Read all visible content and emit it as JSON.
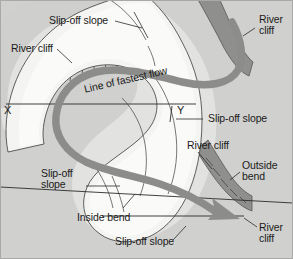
{
  "figure": {
    "width": 293,
    "height": 259,
    "background_color": "#d0d0ce",
    "land_color": "#c8c8c6",
    "slope_color": "#e4e4e2",
    "water_color": "#f2f2f0",
    "cliff_color": "#8d8d8b",
    "flow_color": "#8a8a88",
    "line_color": "#2b2b2b"
  },
  "labels": {
    "slip_off_slope_top": "Slip-off slope",
    "river_cliff_left": "River cliff",
    "river_cliff_topright_l1": "River",
    "river_cliff_topright_l2": "cliff",
    "line_of_fastest_flow": "Line of fastest flow",
    "point_x": "X",
    "point_y": "Y",
    "slip_off_slope_right": "Slip-off slope",
    "river_cliff_mid_right": "River cliff",
    "outside_bend_l1": "Outside",
    "outside_bend_l2": "bend",
    "slip_off_slope_left_l1": "Slip-off",
    "slip_off_slope_left_l2": "slope",
    "inside_bend": "Inside bend",
    "slip_off_slope_bottom": "Slip-off slope",
    "river_cliff_bottomright_l1": "River",
    "river_cliff_bottomright_l2": "cliff"
  },
  "features": {
    "cliffs": [
      "river-cliff-top-left",
      "river-cliff-top-right",
      "river-cliff-bottom-right"
    ],
    "slopes": [
      "slip-off-slope-top",
      "slip-off-slope-right",
      "slip-off-slope-left",
      "slip-off-slope-bottom"
    ],
    "bends": [
      "outside-bend",
      "inside-bend"
    ],
    "section_line": "X-Y cross-section line",
    "flow_arrow": "line-of-fastest-flow-arrow"
  }
}
